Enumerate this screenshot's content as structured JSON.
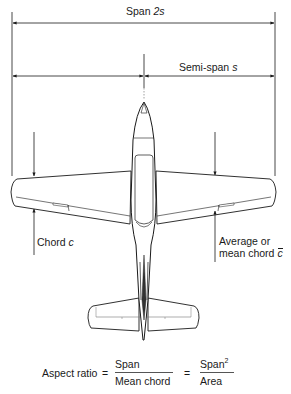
{
  "labels": {
    "span": "Span",
    "span_symbol": "2s",
    "semi_span": "Semi-span",
    "semi_span_symbol": "s",
    "chord": "Chord",
    "chord_symbol": "c",
    "mean_chord_line1": "Average or",
    "mean_chord_line2": "mean chord",
    "mean_chord_symbol": "c"
  },
  "formula": {
    "lhs": "Aspect ratio",
    "eq1": "=",
    "frac1_num": "Span",
    "frac1_den": "Mean chord",
    "eq2": "=",
    "frac2_num": "Span",
    "frac2_num_exp": "2",
    "frac2_den": "Area"
  },
  "colors": {
    "line": "#1a1a1a",
    "thin_line": "#666666"
  }
}
